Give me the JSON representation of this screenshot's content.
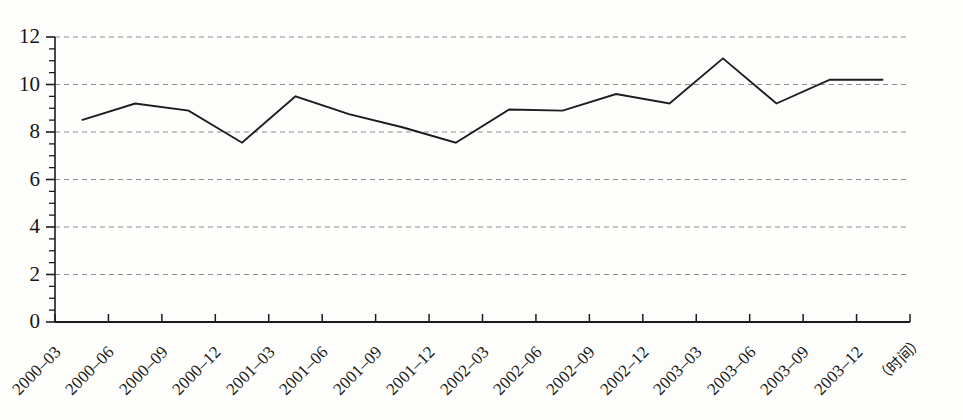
{
  "chart_data": {
    "type": "line",
    "title": "",
    "xlabel": "（时间）",
    "ylabel": "",
    "ylim": [
      0,
      12
    ],
    "ytick_values": [
      0,
      2,
      4,
      6,
      8,
      10,
      12
    ],
    "ytick_labels": [
      "0",
      "2",
      "4",
      "6",
      "8",
      "10",
      "12"
    ],
    "yminor_step": 0.5,
    "grid": "horizontal-dashed",
    "legend": "none",
    "line_color": "#1c1c1c",
    "categories": [
      "2000-03",
      "2000-06",
      "2000-09",
      "2000-12",
      "2001-03",
      "2001-06",
      "2001-09",
      "2001-12",
      "2002-03",
      "2002-06",
      "2002-09",
      "2002-12",
      "2003-03",
      "2003-06",
      "2003-09",
      "2003-12"
    ],
    "values": [
      8.5,
      9.2,
      8.9,
      7.55,
      9.5,
      8.75,
      8.2,
      7.55,
      8.95,
      8.9,
      9.6,
      9.2,
      11.1,
      9.2,
      10.2,
      10.2
    ],
    "series": [
      {
        "name": "series-1",
        "values": [
          8.5,
          9.2,
          8.9,
          7.55,
          9.5,
          8.75,
          8.2,
          7.55,
          8.95,
          8.9,
          9.6,
          9.2,
          11.1,
          9.2,
          10.2,
          10.2
        ]
      }
    ]
  }
}
